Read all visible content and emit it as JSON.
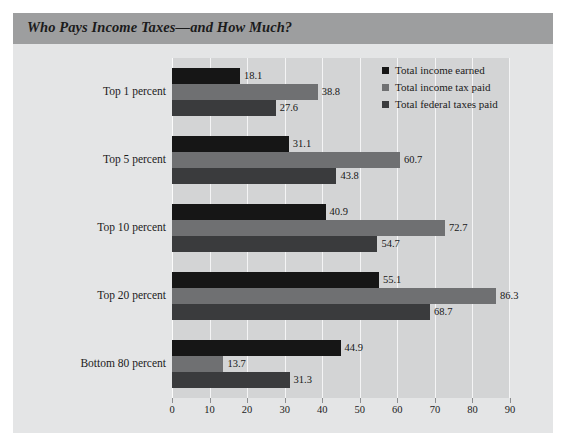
{
  "figure": {
    "title": "Who Pays Income Taxes—and How Much?",
    "background_color": "#e4e5e6",
    "title_bar_color": "#9d9e9f",
    "plot_background_color": "#d3d4d5"
  },
  "chart_data": {
    "type": "bar",
    "orientation": "horizontal",
    "title": "Who Pays Income Taxes—and How Much?",
    "xlabel": "",
    "ylabel": "",
    "xlim": [
      0,
      90
    ],
    "xticks": [
      0,
      10,
      20,
      30,
      40,
      50,
      60,
      70,
      80,
      90
    ],
    "grid": true,
    "legend_position": "upper right",
    "categories": [
      "Top 1 percent",
      "Top 5 percent",
      "Top 10 percent",
      "Top 20 percent",
      "Bottom 80 percent"
    ],
    "series": [
      {
        "name": "Total income earned",
        "color": "#161616",
        "values": [
          18.1,
          31.1,
          40.9,
          55.1,
          44.9
        ]
      },
      {
        "name": "Total income tax paid",
        "color": "#6f7072",
        "values": [
          38.8,
          60.7,
          72.7,
          86.3,
          13.7
        ]
      },
      {
        "name": "Total federal taxes paid",
        "color": "#3a3b3d",
        "values": [
          27.6,
          43.8,
          54.7,
          68.7,
          31.3
        ]
      }
    ]
  }
}
